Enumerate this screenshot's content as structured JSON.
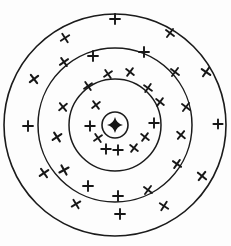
{
  "figure": {
    "background_color": "#fdfdfd",
    "ink_color": "#1b1b1b",
    "width": 231,
    "height": 246,
    "center": {
      "x": 115,
      "y": 125
    }
  },
  "chart_data": {
    "type": "scatter",
    "subtitle": "",
    "xlabel": "",
    "ylabel": "",
    "grid": false,
    "legend": "none",
    "xlim": [
      0,
      231
    ],
    "ylim": [
      0,
      246
    ],
    "center": {
      "x": 115,
      "y": 125
    },
    "rings": [
      {
        "name": "bullseye",
        "index": 1,
        "radius": 13,
        "stroke_width": 1.6
      },
      {
        "name": "inner-ring",
        "index": 2,
        "radius": 46,
        "stroke_width": 1.5
      },
      {
        "name": "middle-ring",
        "index": 3,
        "radius": 77,
        "stroke_width": 1.5
      },
      {
        "name": "outer-ring",
        "index": 4,
        "radius": 111,
        "stroke_width": 1.6
      }
    ],
    "bullseye_core": {
      "shape": "four-point-star",
      "cx": 115,
      "cy": 125,
      "radius_long": 8,
      "radius_short": 3.4,
      "fill": "#141414"
    },
    "marks": [
      {
        "x": 115,
        "y": 19,
        "glyph": "plus",
        "size": 5.0,
        "rot": 0,
        "zone": "outer-ring"
      },
      {
        "x": 65,
        "y": 38,
        "glyph": "cross",
        "size": 5.0,
        "rot": 12,
        "zone": "outer-ring"
      },
      {
        "x": 170,
        "y": 33,
        "glyph": "cross",
        "size": 5.0,
        "rot": -8,
        "zone": "outer-ring"
      },
      {
        "x": 34,
        "y": 79,
        "glyph": "cross",
        "size": 5.2,
        "rot": 8,
        "zone": "outer-ring"
      },
      {
        "x": 206,
        "y": 72,
        "glyph": "cross",
        "size": 5.2,
        "rot": -10,
        "zone": "outer-ring"
      },
      {
        "x": 28,
        "y": 126,
        "glyph": "plus",
        "size": 5.0,
        "rot": 0,
        "zone": "outer-ring"
      },
      {
        "x": 218,
        "y": 124,
        "glyph": "plus",
        "size": 4.6,
        "rot": 0,
        "zone": "outer-ring"
      },
      {
        "x": 44,
        "y": 173,
        "glyph": "cross",
        "size": 5.2,
        "rot": 10,
        "zone": "outer-ring"
      },
      {
        "x": 202,
        "y": 176,
        "glyph": "cross",
        "size": 5.2,
        "rot": -6,
        "zone": "outer-ring"
      },
      {
        "x": 76,
        "y": 204,
        "glyph": "cross",
        "size": 5.0,
        "rot": 14,
        "zone": "outer-ring"
      },
      {
        "x": 164,
        "y": 206,
        "glyph": "cross",
        "size": 5.0,
        "rot": -12,
        "zone": "outer-ring"
      },
      {
        "x": 120,
        "y": 214,
        "glyph": "plus",
        "size": 5.0,
        "rot": 0,
        "zone": "outer-ring"
      },
      {
        "x": 64,
        "y": 62,
        "glyph": "cross",
        "size": 5.0,
        "rot": 10,
        "zone": "middle-ring"
      },
      {
        "x": 175,
        "y": 72,
        "glyph": "cross",
        "size": 5.0,
        "rot": -8,
        "zone": "middle-ring"
      },
      {
        "x": 63,
        "y": 107,
        "glyph": "cross",
        "size": 5.0,
        "rot": 6,
        "zone": "middle-ring"
      },
      {
        "x": 186,
        "y": 107,
        "glyph": "cross",
        "size": 5.0,
        "rot": -8,
        "zone": "middle-ring"
      },
      {
        "x": 57,
        "y": 137,
        "glyph": "cross",
        "size": 5.2,
        "rot": 12,
        "zone": "middle-ring"
      },
      {
        "x": 181,
        "y": 135,
        "glyph": "cross",
        "size": 5.0,
        "rot": -6,
        "zone": "middle-ring"
      },
      {
        "x": 64,
        "y": 170,
        "glyph": "cross",
        "size": 5.2,
        "rot": 16,
        "zone": "middle-ring"
      },
      {
        "x": 177,
        "y": 164,
        "glyph": "cross",
        "size": 5.0,
        "rot": -10,
        "zone": "middle-ring"
      },
      {
        "x": 88,
        "y": 186,
        "glyph": "plus",
        "size": 5.0,
        "rot": 0,
        "zone": "middle-ring"
      },
      {
        "x": 148,
        "y": 190,
        "glyph": "cross",
        "size": 5.0,
        "rot": -8,
        "zone": "middle-ring"
      },
      {
        "x": 118,
        "y": 196,
        "glyph": "plus",
        "size": 5.0,
        "rot": 0,
        "zone": "middle-ring"
      },
      {
        "x": 93,
        "y": 56,
        "glyph": "plus",
        "size": 5.0,
        "rot": 0,
        "zone": "middle-ring"
      },
      {
        "x": 144,
        "y": 52,
        "glyph": "plus",
        "size": 5.0,
        "rot": 0,
        "zone": "middle-ring"
      },
      {
        "x": 108,
        "y": 74,
        "glyph": "cross",
        "size": 4.8,
        "rot": 10,
        "zone": "inner-ring"
      },
      {
        "x": 130,
        "y": 72,
        "glyph": "cross",
        "size": 4.8,
        "rot": -8,
        "zone": "inner-ring"
      },
      {
        "x": 88,
        "y": 86,
        "glyph": "cross",
        "size": 4.8,
        "rot": 10,
        "zone": "inner-ring"
      },
      {
        "x": 148,
        "y": 88,
        "glyph": "cross",
        "size": 4.8,
        "rot": -10,
        "zone": "inner-ring"
      },
      {
        "x": 96,
        "y": 105,
        "glyph": "cross",
        "size": 4.8,
        "rot": 8,
        "zone": "inner-ring"
      },
      {
        "x": 160,
        "y": 102,
        "glyph": "cross",
        "size": 4.8,
        "rot": -8,
        "zone": "inner-ring"
      },
      {
        "x": 90,
        "y": 126,
        "glyph": "plus",
        "size": 4.8,
        "rot": 0,
        "zone": "inner-ring"
      },
      {
        "x": 154,
        "y": 123,
        "glyph": "plus",
        "size": 4.8,
        "rot": 0,
        "zone": "inner-ring"
      },
      {
        "x": 98,
        "y": 138,
        "glyph": "cross",
        "size": 4.8,
        "rot": 10,
        "zone": "inner-ring"
      },
      {
        "x": 145,
        "y": 137,
        "glyph": "cross",
        "size": 4.8,
        "rot": -8,
        "zone": "inner-ring"
      },
      {
        "x": 106,
        "y": 149,
        "glyph": "plus",
        "size": 4.8,
        "rot": 0,
        "zone": "inner-ring"
      },
      {
        "x": 118,
        "y": 150,
        "glyph": "plus",
        "size": 4.8,
        "rot": 0,
        "zone": "inner-ring"
      },
      {
        "x": 134,
        "y": 148,
        "glyph": "cross",
        "size": 4.8,
        "rot": -8,
        "zone": "inner-ring"
      }
    ],
    "mark_counts": {
      "outer-ring": 12,
      "middle-ring": 13,
      "inner-ring": 13,
      "total": 38
    }
  }
}
